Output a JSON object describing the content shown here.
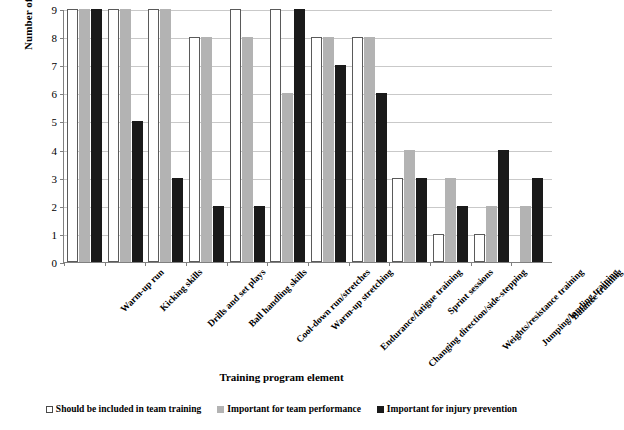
{
  "chart_data": {
    "type": "bar",
    "title": "",
    "xlabel": "Training program element",
    "ylabel": "Number of coaches who agreed",
    "ylim": [
      0,
      9
    ],
    "yticks": [
      0,
      1,
      2,
      3,
      4,
      5,
      6,
      7,
      8,
      9
    ],
    "grid": true,
    "legend_position": "bottom",
    "categories": [
      "Warm-up run",
      "Kicking skills",
      "Drills and set plays",
      "Ball handling skills",
      "Cool-down run/stretches",
      "Warm-up stretching",
      "Endurance/fatigue training",
      "Changing direction/side-stepping",
      "Sprint sessions",
      "Weights/resistance training",
      "Jumping/landing training",
      "Balance training"
    ],
    "series": [
      {
        "name": "Should be included in team training",
        "color": "#ffffff",
        "values": [
          9,
          9,
          9,
          8,
          9,
          9,
          8,
          8,
          3,
          1,
          1,
          0
        ]
      },
      {
        "name": "Important for team performance",
        "color": "#b3b3b3",
        "values": [
          9,
          9,
          9,
          8,
          8,
          6,
          8,
          8,
          4,
          3,
          2,
          2
        ]
      },
      {
        "name": "Important for injury prevention",
        "color": "#1a1a1a",
        "values": [
          9,
          5,
          3,
          2,
          2,
          9,
          7,
          6,
          3,
          2,
          4,
          3
        ]
      }
    ]
  }
}
